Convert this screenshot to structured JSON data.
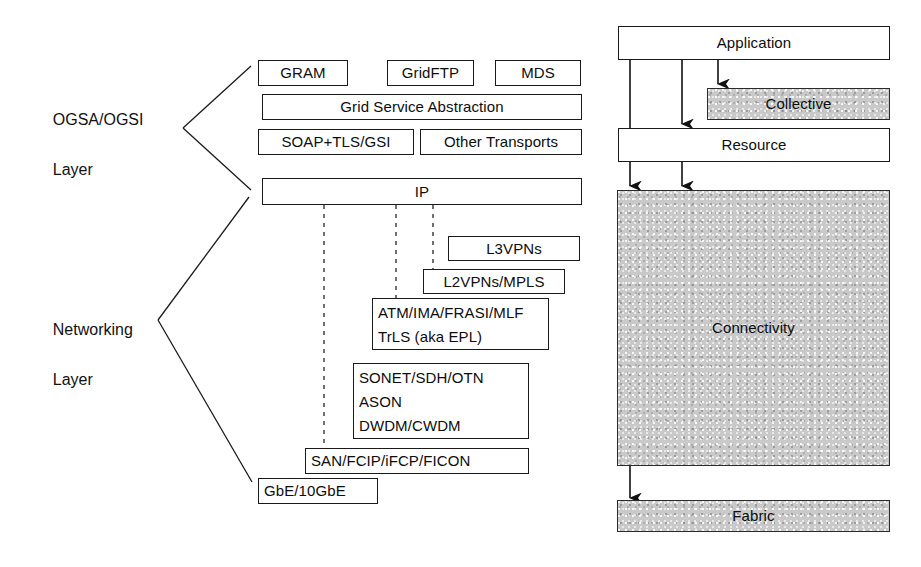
{
  "diagram": {
    "colors": {
      "stroke": "#1a1a1a",
      "shaded_fill": "#c9c9c9",
      "background": "#ffffff"
    },
    "left_labels": [
      {
        "line1": "OGSA/OGSI",
        "line2": "Layer"
      },
      {
        "line1": "Networking",
        "line2": "Layer"
      }
    ],
    "ogsa_boxes": {
      "gram": "GRAM",
      "gridftp": "GridFTP",
      "mds": "MDS",
      "grid_service_abstraction": "Grid Service Abstraction",
      "soap_tls_gsi": "SOAP+TLS/GSI",
      "other_transports": "Other Transports"
    },
    "networking_boxes": {
      "ip": "IP",
      "l3vpns": "L3VPNs",
      "l2vpns_mpls": "L2VPNs/MPLS",
      "atm_block_line1": "ATM/IMA/FRASI/MLF",
      "atm_block_line2": "TrLS (aka EPL)",
      "optical_line1": "SONET/SDH/OTN",
      "optical_line2": "ASON",
      "optical_line3": "DWDM/CWDM",
      "san": "SAN/FCIP/iFCP/FICON",
      "gbe": "GbE/10GbE"
    },
    "grid_stack": {
      "application": "Application",
      "collective": "Collective",
      "resource": "Resource",
      "connectivity": "Connectivity",
      "fabric": "Fabric"
    }
  }
}
